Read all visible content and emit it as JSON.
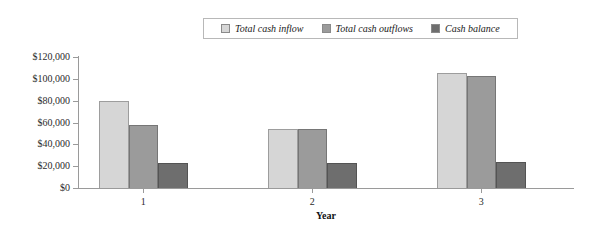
{
  "chart_data": {
    "type": "bar",
    "title": "",
    "xlabel": "Year",
    "ylabel": "",
    "categories": [
      "1",
      "2",
      "3"
    ],
    "series": [
      {
        "name": "Total cash inflow",
        "values": [
          80000,
          54000,
          105000
        ],
        "color": "#d6d6d6"
      },
      {
        "name": "Total cash outflows",
        "values": [
          57500,
          54000,
          102500
        ],
        "color": "#9b9b9b"
      },
      {
        "name": "Cash balance",
        "values": [
          22500,
          22500,
          24000
        ],
        "color": "#6e6e6e"
      }
    ],
    "ylim": [
      0,
      120000
    ],
    "ytick_values": [
      0,
      20000,
      40000,
      60000,
      80000,
      100000,
      120000
    ],
    "ytick_labels": [
      "$0",
      "$20,000",
      "$40,000",
      "$60,000",
      "$80,000",
      "$100,000",
      "$120,000"
    ],
    "grid": false,
    "legend_position": "top-center"
  },
  "legend": {
    "items": [
      {
        "label": "Total cash inflow"
      },
      {
        "label": "Total cash outflows"
      },
      {
        "label": "Cash balance"
      }
    ]
  },
  "axes": {
    "x_title": "Year",
    "x_labels": [
      "1",
      "2",
      "3"
    ],
    "y_labels": [
      "$120,000",
      "$100,000",
      "$80,000",
      "$60,000",
      "$40,000",
      "$20,000",
      "$0"
    ]
  }
}
